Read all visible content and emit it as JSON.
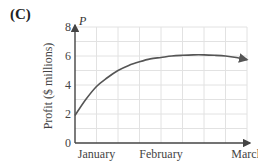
{
  "panel_label": "(C)",
  "colors": {
    "axis": "#444444",
    "grid": "#e2e2e2",
    "curve": "#555555",
    "text": "#444444"
  },
  "chart_data": {
    "type": "line",
    "title": "",
    "panel": "(C)",
    "xlabel": "",
    "ylabel": "Profit ($ millions)",
    "y_axis_variable": "P",
    "x_tick_labels": [
      "January",
      "February",
      "March"
    ],
    "y_ticks": [
      0,
      2,
      4,
      6,
      8
    ],
    "ylim": [
      0,
      8
    ],
    "xlim": [
      0,
      8
    ],
    "grid": true,
    "legend": null,
    "series": [
      {
        "name": "P",
        "x": [
          0,
          0.5,
          1,
          1.5,
          2,
          2.5,
          3,
          3.5,
          4,
          4.5,
          5,
          5.5,
          6,
          6.5,
          7,
          7.5,
          8
        ],
        "values": [
          1.9,
          3.0,
          3.9,
          4.5,
          5.0,
          5.35,
          5.6,
          5.8,
          5.9,
          6.0,
          6.05,
          6.08,
          6.08,
          6.05,
          6.0,
          5.9,
          5.75
        ],
        "end_arrow": true
      }
    ]
  }
}
